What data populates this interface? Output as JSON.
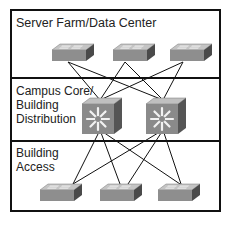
{
  "layers": [
    {
      "id": "server-farm",
      "label": "Server Farm/Data Center"
    },
    {
      "id": "campus-core",
      "label_lines": [
        "Campus Core/",
        "Building",
        "Distribution"
      ]
    },
    {
      "id": "building-access",
      "label_lines": [
        "Building",
        "Access"
      ]
    }
  ],
  "devices": {
    "top_switches": [
      "switch",
      "switch",
      "switch"
    ],
    "core_switches": [
      "multilayer-switch",
      "multilayer-switch"
    ],
    "access_switches": [
      "switch",
      "switch",
      "switch"
    ]
  },
  "colors": {
    "switch_top": "#b8b8b8",
    "switch_front": "#8e8e8e",
    "switch_side": "#555555",
    "mls_front": "#8a8a8a",
    "mls_top": "#bdbdbd",
    "mls_side": "#5a5a5a",
    "line": "#111111"
  }
}
